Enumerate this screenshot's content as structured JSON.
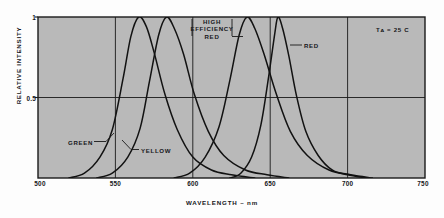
{
  "chart_data": {
    "type": "line",
    "title": "",
    "xlabel": "WAVELENGTH – nm",
    "ylabel": "RELATIVE INTENSITY",
    "xlim": [
      500,
      750
    ],
    "ylim": [
      0,
      1
    ],
    "xticks": [
      "500",
      "550",
      "600",
      "650",
      "700",
      "750"
    ],
    "xtick_values": [
      500,
      550,
      600,
      650,
      700,
      750
    ],
    "yticks": [
      "0.5",
      "1"
    ],
    "ytick_values": [
      0.5,
      1
    ],
    "grid": "vertical gridlines at 550, 600, 650, 700; horizontal gridline at 0.5",
    "legend_position": "inline-annotations",
    "plot_background": "#b9b9b9",
    "curve_color": "#121212",
    "annotations": [
      {
        "name": "ambient-temperature",
        "text": "Tᴀ = 25 C"
      }
    ],
    "series": [
      {
        "name": "GREEN",
        "label": "GREEN",
        "peak_wavelength": 565,
        "peak_value": 1,
        "half_width_nm": 30,
        "points_x": [
          520,
          530,
          540,
          548,
          555,
          560,
          565,
          570,
          575,
          582,
          590,
          600,
          612,
          625,
          640
        ],
        "points_y": [
          0.0,
          0.03,
          0.13,
          0.3,
          0.62,
          0.88,
          1.0,
          0.94,
          0.78,
          0.52,
          0.3,
          0.13,
          0.05,
          0.02,
          0.0
        ]
      },
      {
        "name": "YELLOW",
        "label": "YELLOW",
        "peak_wavelength": 583,
        "peak_value": 1,
        "half_width_nm": 32,
        "points_x": [
          538,
          548,
          558,
          566,
          572,
          578,
          583,
          588,
          594,
          601,
          610,
          620,
          634,
          648,
          662
        ],
        "points_y": [
          0.0,
          0.03,
          0.13,
          0.31,
          0.6,
          0.89,
          1.0,
          0.93,
          0.77,
          0.52,
          0.29,
          0.14,
          0.05,
          0.02,
          0.0
        ]
      },
      {
        "name": "HIGH EFFICIENCY RED",
        "label": "HIGH EFFICIENCY RED",
        "peak_wavelength": 635,
        "peak_value": 1,
        "half_width_nm": 34,
        "points_x": [
          588,
          598,
          608,
          617,
          624,
          630,
          635,
          640,
          646,
          654,
          663,
          674,
          688,
          702,
          716
        ],
        "points_y": [
          0.0,
          0.03,
          0.13,
          0.32,
          0.61,
          0.89,
          1.0,
          0.93,
          0.77,
          0.52,
          0.29,
          0.14,
          0.05,
          0.02,
          0.0
        ]
      },
      {
        "name": "RED",
        "label": "RED",
        "peak_wavelength": 655,
        "peak_value": 1,
        "half_width_nm": 22,
        "points_x": [
          624,
          631,
          638,
          644,
          649,
          653,
          655,
          658,
          662,
          667,
          673,
          681,
          690,
          700,
          712
        ],
        "points_y": [
          0.0,
          0.03,
          0.13,
          0.33,
          0.63,
          0.9,
          1.0,
          0.93,
          0.76,
          0.51,
          0.29,
          0.14,
          0.05,
          0.02,
          0.0
        ]
      }
    ]
  },
  "labels": {
    "green": "GREEN",
    "yellow": "YELLOW",
    "high_efficiency_red_line1": "HIGH",
    "high_efficiency_red_line2": "EFFICIENCY",
    "high_efficiency_red_line3": "RED",
    "red": "RED",
    "temperature": "Tᴀ = 25 C",
    "ylabel": "RELATIVE INTENSITY",
    "xlabel": "WAVELENGTH – nm",
    "y_tick_top": "1",
    "y_tick_mid": "0.5",
    "x_tick_500": "500",
    "x_tick_550": "550",
    "x_tick_600": "600",
    "x_tick_650": "650",
    "x_tick_700": "700",
    "x_tick_750": "750"
  }
}
